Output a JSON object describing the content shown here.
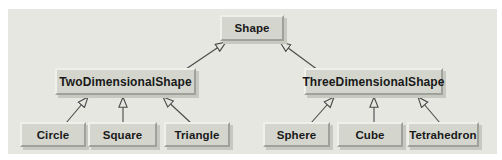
{
  "diagram": {
    "type": "inheritance-hierarchy",
    "nodes": {
      "shape": {
        "label": "Shape"
      },
      "two_dimensional_shape": {
        "label": "TwoDimensionalShape"
      },
      "three_dimensional_shape": {
        "label": "ThreeDimensionalShape"
      },
      "circle": {
        "label": "Circle"
      },
      "square": {
        "label": "Square"
      },
      "triangle": {
        "label": "Triangle"
      },
      "sphere": {
        "label": "Sphere"
      },
      "cube": {
        "label": "Cube"
      },
      "tetrahedron": {
        "label": "Tetrahedron"
      }
    },
    "edges": [
      {
        "from": "TwoDimensionalShape",
        "to": "Shape"
      },
      {
        "from": "ThreeDimensionalShape",
        "to": "Shape"
      },
      {
        "from": "Circle",
        "to": "TwoDimensionalShape"
      },
      {
        "from": "Square",
        "to": "TwoDimensionalShape"
      },
      {
        "from": "Triangle",
        "to": "TwoDimensionalShape"
      },
      {
        "from": "Sphere",
        "to": "ThreeDimensionalShape"
      },
      {
        "from": "Cube",
        "to": "ThreeDimensionalShape"
      },
      {
        "from": "Tetrahedron",
        "to": "ThreeDimensionalShape"
      }
    ],
    "arrow_style": "hollow-triangle-generalization",
    "colors": {
      "page_background": "#ffffff",
      "panel_background": "#e5e7e0",
      "node_fill": "#d4d6ce",
      "node_bevel_light": "#eef0e9",
      "node_bevel_dark": "#9fa29a",
      "node_shadow": "#c7c9c1",
      "node_text": "#191919",
      "arrow_stroke": "#4a4a4a"
    }
  }
}
